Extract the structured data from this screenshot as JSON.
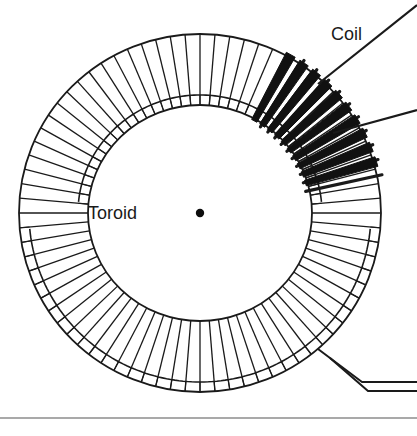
{
  "figure": {
    "type": "technical-diagram",
    "background_color": "#ffffff",
    "ink_color": "#1a1a1a",
    "shade_color": "#c9c9c9",
    "width": 417,
    "height": 436
  },
  "labels": [
    {
      "id": "toroid",
      "text": "Toroid",
      "x": 88,
      "y": 219,
      "anchor": "start",
      "font_size": 18
    },
    {
      "id": "coil",
      "text": "Coil",
      "x": 331,
      "y": 40,
      "anchor": "start",
      "font_size": 18
    }
  ],
  "toroid": {
    "center": {
      "x": 200,
      "y": 213
    },
    "outer_radius_x": 181,
    "outer_radius_y": 179,
    "inner_radius_x": 112,
    "inner_radius_y": 108,
    "wall_thickness": 10,
    "winding_turns": 76,
    "winding_stroke_width": 1.3,
    "outer_wall_shade": "#d2d2d2",
    "inner_wall_shade": "#c4c4c4"
  },
  "coil_section": {
    "description": "Bold three-dimensional wire loops on the upper-right arc",
    "start_angle_deg": -62,
    "end_angle_deg": -18,
    "loop_count": 10,
    "stroke_width": 3.2,
    "fill": "#111111"
  },
  "leader_lines": [
    {
      "id": "coil-leader-upper",
      "from": {
        "x": 318,
        "y": 84
      },
      "to": {
        "x": 417,
        "y": 5
      },
      "stroke_width": 2.2
    },
    {
      "id": "coil-leader-lower",
      "from": {
        "x": 333,
        "y": 133
      },
      "to": {
        "x": 417,
        "y": 110
      },
      "stroke_width": 2.2
    }
  ],
  "lead_wires": {
    "id": "terminal-leads",
    "description": "Two parallel wire leads exiting the winding at lower right, bending to horizontal",
    "stroke_width": 2.0,
    "paths": [
      "M 318 349 L 362 382 L 417 382",
      "M 330 358 L 368 391 L 417 391"
    ]
  },
  "baseline_rule": {
    "id": "bottom-rule",
    "y": 418,
    "x_start": 0,
    "x_end": 417,
    "color": "#8c8c8c",
    "stroke_width": 1.4
  },
  "center_dot": {
    "x": 200,
    "y": 213,
    "radius": 4.2,
    "color": "#0d0d0d"
  }
}
